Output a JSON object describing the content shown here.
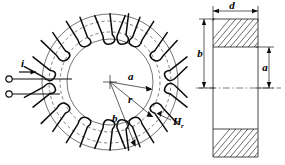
{
  "figure": {
    "type": "engineering-diagram",
    "views": [
      {
        "name": "front-view",
        "description": "wound toroid with radial dimensions"
      },
      {
        "name": "cross-section-view",
        "description": "rectangular core cross section"
      }
    ]
  },
  "labels": {
    "current": "i",
    "inner_radius": "a",
    "field_radius": "r",
    "outer_radius": "b",
    "field_symbol": "H",
    "field_subscript": "r",
    "section_height": "b",
    "section_inner": "a",
    "section_width": "d"
  },
  "geometry": {
    "toroid_center_x": 110,
    "toroid_center_y": 82,
    "inner_radius_px": 43,
    "outer_radius_px": 68,
    "mean_radius_px": 55,
    "winding_turns": 14,
    "section_left_x": 213,
    "section_right_x": 258,
    "section_top_y": 19,
    "section_bottom_y": 157,
    "core_band_height_px": 28
  },
  "colors": {
    "ink": "#0d0d0d",
    "line": "#1a1a1a",
    "light_line": "#3a3a3a",
    "background": "#ffffff"
  }
}
